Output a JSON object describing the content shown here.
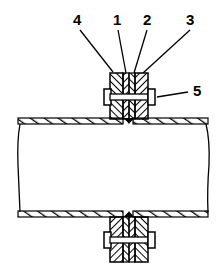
{
  "diagram": {
    "type": "pipe-flange-joint-cross-section",
    "labels": [
      {
        "id": "label-4",
        "text": "4",
        "x": 73,
        "y": 12,
        "target": "left-flange"
      },
      {
        "id": "label-1",
        "text": "1",
        "x": 113,
        "y": 12,
        "target": "left-pipe-end-collar"
      },
      {
        "id": "label-2",
        "text": "2",
        "x": 143,
        "y": 12,
        "target": "right-pipe-end-collar"
      },
      {
        "id": "label-3",
        "text": "3",
        "x": 186,
        "y": 12,
        "target": "right-flange"
      },
      {
        "id": "label-5",
        "text": "5",
        "x": 193,
        "y": 83,
        "target": "bolt"
      }
    ],
    "colors": {
      "stroke": "#000000",
      "background": "#ffffff"
    }
  }
}
